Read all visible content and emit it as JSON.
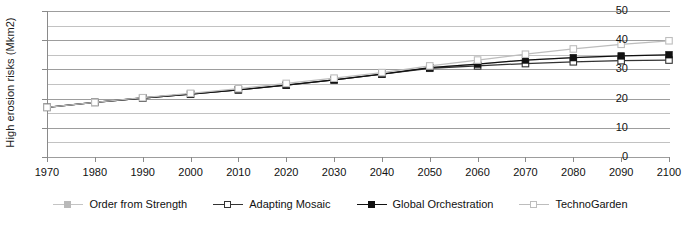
{
  "chart_data": {
    "type": "line",
    "title": "",
    "subtitle": "",
    "xlabel": "",
    "ylabel": "High erosion risks (Mkm2)",
    "xlim": [
      1970,
      2100
    ],
    "ylim": [
      0,
      50
    ],
    "y_major_step": 10,
    "y_minor_step": 5,
    "grid": true,
    "grid_axis": "y",
    "legend_position": "bottom",
    "x": [
      1970,
      1980,
      1990,
      2000,
      2010,
      2020,
      2030,
      2040,
      2050,
      2060,
      2070,
      2080,
      2090,
      2100
    ],
    "categories": [
      "1970",
      "1980",
      "1990",
      "2000",
      "2010",
      "2020",
      "2030",
      "2040",
      "2050",
      "2060",
      "2070",
      "2080",
      "2090",
      "2100"
    ],
    "yticks": [
      0,
      10,
      20,
      30,
      40,
      50
    ],
    "ytick_labels": [
      "0",
      "10",
      "20",
      "30",
      "40",
      "50"
    ],
    "yticks_minor": [
      5,
      15,
      25,
      35,
      45
    ],
    "series": [
      {
        "name": "Order from Strength",
        "marker": "filled-square",
        "color": "#b9b9b9",
        "line_color": "#c4c4c4",
        "values": [
          17.0,
          18.7,
          20.2,
          21.5,
          23.0,
          24.6,
          26.4,
          28.4,
          30.6,
          31.8,
          33.2,
          34.0,
          34.6,
          35.0
        ]
      },
      {
        "name": "Adapting Mosaic",
        "marker": "open-square",
        "color": "#ffffff",
        "line_color": "#333333",
        "values": [
          17.0,
          18.7,
          20.2,
          21.5,
          23.0,
          24.6,
          26.4,
          28.4,
          30.4,
          31.2,
          32.0,
          32.6,
          33.0,
          33.2
        ]
      },
      {
        "name": "Global Orchestration",
        "marker": "filled-square",
        "color": "#111111",
        "line_color": "#111111",
        "values": [
          17.0,
          18.7,
          20.2,
          21.5,
          23.0,
          24.6,
          26.4,
          28.4,
          30.6,
          31.8,
          33.2,
          34.0,
          34.6,
          35.0
        ]
      },
      {
        "name": "TechnoGarden",
        "marker": "open-square",
        "color": "#ffffff",
        "line_color": "#bdbdbd",
        "values": [
          17.0,
          18.7,
          20.3,
          21.8,
          23.4,
          25.2,
          27.0,
          28.9,
          31.2,
          33.2,
          35.2,
          37.0,
          38.6,
          39.8
        ]
      }
    ]
  },
  "legend": {
    "items": [
      {
        "label": "Order from Strength"
      },
      {
        "label": "Adapting Mosaic"
      },
      {
        "label": "Global Orchestration"
      },
      {
        "label": "TechnoGarden"
      }
    ]
  },
  "colors": {
    "axis": "#8a8a8a",
    "grid_major": "#9d9d9d",
    "grid_minor": "#c2c2c2",
    "text": "#111111",
    "background": "#ffffff"
  }
}
